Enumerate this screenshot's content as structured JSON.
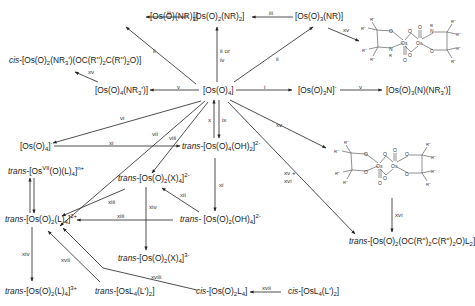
{
  "diagram": {
    "type": "reaction-scheme",
    "central_node": "[Os(O)4]",
    "nodes": {
      "os_o_nr3": "[Os(O)(NR)3]",
      "os_o2_nr2": "[Os(O)2(NR)2]",
      "os_o3_nr": "[Os(O)3(NR)]",
      "cis_os_o2_nr3_diol": "cis-[Os(O)2(NR3')(OC(R'')2C(R'')2O)]",
      "os_o4_nr3": "[Os(O)4(NR3')]",
      "os_o4": "[Os(O)4]",
      "os_o3_n": "[Os(O)3N]-",
      "os_o3_n_nr3": "[Os(O)3(N)(NR3')]",
      "os_o4_minus": "[Os(O)4]-",
      "trans_os_o4_oh2": "trans-[Os(O)4(OH)2]2-",
      "trans_osvii_o_l4": "trans-[OsVII(O)(L)4]n+",
      "trans_os_o2_x4_2minus": "trans-[Os(O)2(X)4]2-",
      "trans_os_o2_l4_2plus": "trans-[Os(O)2(L)4]2+",
      "trans_os_o2_oh4": "trans- [Os(O)2(OH)4]2-",
      "trans_os_o2_x4_3minus": "trans-[Os(O)2(X)4]3-",
      "trans_os_o2_l4_3plus": "trans-[Os(O)2(L)4]3+",
      "trans_osl4_l2": "trans-[OsL4(L')2]",
      "cis_os_o2_l4": "cis-[Os(O)2L4]",
      "cis_osl4_l2": "cis-[OsL4(L')2]",
      "trans_os_o2_diol_l2": "trans-[Os(O)2(OC(R'')2C(R'')2O)L2]",
      "dimer_amino": "Os2 bis(amino-alkoxide) dimer",
      "dimer_diolate": "Os2 bis(diolate) dimer"
    },
    "edges": [
      {
        "from": "[Os(O)2(NR)2]",
        "to": "[Os(O)(NR)3]",
        "label": "iii"
      },
      {
        "from": "[Os(O)3(NR)]",
        "to": "[Os(O)2(NR)2]",
        "label": "iii"
      },
      {
        "from": "[Os(O)4]",
        "to": "[Os(O)(NR)3]",
        "label": "ii"
      },
      {
        "from": "[Os(O)4]",
        "to": "[Os(O)2(NR)2]",
        "label": "ii or iv"
      },
      {
        "from": "[Os(O)4]",
        "to": "[Os(O)3(NR)]",
        "label": "ii"
      },
      {
        "from": "[Os(O)3(NR)]",
        "to": "dimer_amino",
        "label": "xv"
      },
      {
        "from": "[Os(O)4(NR3')]",
        "to": "cis-[Os(O)2(NR3')(OC(R'')2C(R'')2O)]",
        "label": "xv"
      },
      {
        "from": "[Os(O)4]",
        "to": "[Os(O)4(NR3')]",
        "label": "v"
      },
      {
        "from": "[Os(O)4]",
        "to": "[Os(O)3N]-",
        "label": "i"
      },
      {
        "from": "[Os(O)3N]-",
        "to": "[Os(O)3(N)(NR3')]",
        "label": "v"
      },
      {
        "from": "[Os(O)4]",
        "to": "[Os(O)4]-",
        "label": "vi"
      },
      {
        "from": "[Os(O)4]",
        "to": "trans-[Os(O)4(OH)2]2-",
        "label": "ix"
      },
      {
        "from": "trans-[Os(O)4(OH)2]2-",
        "to": "[Os(O)4]",
        "label": "x"
      },
      {
        "from": "[Os(O)4]-",
        "to": "trans-[Os(O)4(OH)2]2-",
        "label": "xi"
      },
      {
        "from": "[Os(O)4]",
        "to": "trans-[Os(O)2(L)4]2+",
        "label": "vii"
      },
      {
        "from": "[Os(O)4]",
        "to": "trans-[Os(O)2(X)4]2-",
        "label": "viii"
      },
      {
        "from": "[Os(O)4]",
        "to": "dimer_diolate",
        "label": "xv"
      },
      {
        "from": "[Os(O)4]",
        "to": "trans-[Os(O)2(OC(R'')2C(R'')2O)L2]",
        "label": "xv + xvi"
      },
      {
        "from": "trans-[Os(O)4(OH)2]2-",
        "to": "trans- [Os(O)2(OH)4]2-",
        "label": "xi"
      },
      {
        "from": "trans- [Os(O)2(OH)4]2-",
        "to": "trans-[Os(O)2(X)4]2-",
        "label": "xii"
      },
      {
        "from": "trans-[Os(O)2(X)4]2-",
        "to": "trans-[Os(O)2(L)4]2+",
        "label": "xiii"
      },
      {
        "from": "trans- [Os(O)2(OH)4]2-",
        "to": "trans-[Os(O)2(L)4]2+",
        "label": "xiii"
      },
      {
        "from": "trans-[Os(O)2(X)4]2-",
        "to": "trans-[Os(O)2(X)4]3-",
        "label": "xiv"
      },
      {
        "from": "trans-[Os(O)2(L)4]2+",
        "to": "trans-[Os(O)2(L)4]3+",
        "label": "xiv"
      },
      {
        "from": "trans-[OsL4(L')2]",
        "to": "trans-[Os(O)2(L)4]2+",
        "label": "xvii"
      },
      {
        "from": "cis-[Os(O)2L4]",
        "to": "trans-[Os(O)2(L)4]2+",
        "label": "xviii"
      },
      {
        "from": "cis-[OsL4(L')2]",
        "to": "cis-[Os(O)2L4]",
        "label": "xvii"
      },
      {
        "from": "trans-[Os(O)2(L)4]2+",
        "to": "trans-[OsVII(O)(L)4]n+",
        "label": ""
      },
      {
        "from": "trans-[OsVII(O)(L)4]n+",
        "to": "trans-[Os(O)2(L)4]2+",
        "label": ""
      },
      {
        "from": "dimer_diolate",
        "to": "trans-[Os(O)2(OC(R'')2C(R'')2O)L2]",
        "label": "xvi"
      }
    ],
    "labels": {
      "iii_a": "iii",
      "iii_b": "iii",
      "ii_a": "ii",
      "ii_or_iv_1": "ii or",
      "ii_or_iv_2": "iv",
      "ii_b": "ii",
      "xv_a": "xv",
      "xv_b": "xv",
      "v_a": "v",
      "i": "i",
      "v_b": "v",
      "vi": "vi",
      "vii": "vii",
      "viii": "viii",
      "x": "x",
      "ix": "ix",
      "xi_a": "xi",
      "xv_c": "xv",
      "xv_xvi_1": "xv +",
      "xv_xvi_2": "xvi",
      "xi_b": "xi",
      "xii": "xii",
      "xiii_a": "xiii",
      "xiii_b": "xiii",
      "xiv_a": "xiv",
      "xiv_b": "xiv",
      "xvii_a": "xvii",
      "xviii": "xviii",
      "xvii_b": "xvii",
      "xvi": "xvi"
    },
    "structure_atoms": {
      "R2": "R''",
      "R": "R",
      "O": "O",
      "N": "N",
      "Os": "Os"
    }
  }
}
